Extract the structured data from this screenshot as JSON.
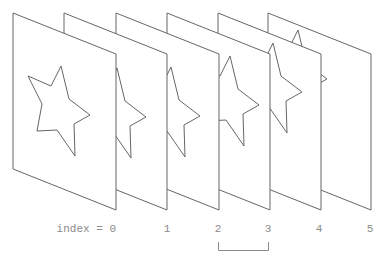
{
  "diagram": {
    "title": "",
    "frame_geometry": {
      "width": 103,
      "height": 156,
      "skew_drop": 41,
      "origin_y": 13
    },
    "frames": [
      {
        "index": 0,
        "x": 13,
        "star_offset": [
          0,
          0
        ]
      },
      {
        "index": 1,
        "x": 64,
        "star_offset": [
          5,
          2
        ]
      },
      {
        "index": 2,
        "x": 116,
        "star_offset": [
          7,
          1
        ]
      },
      {
        "index": 3,
        "x": 167,
        "star_offset": [
          15,
          -10
        ]
      },
      {
        "index": 4,
        "x": 218,
        "star_offset": [
          7,
          -23
        ]
      },
      {
        "index": 5,
        "x": 268,
        "star_offset": [
          -18,
          -36
        ]
      }
    ],
    "star_points_local": [
      [
        48,
        53
      ],
      [
        38,
        73
      ],
      [
        15,
        63
      ],
      [
        29,
        91
      ],
      [
        24,
        118
      ],
      [
        44,
        117
      ],
      [
        62,
        143
      ],
      [
        61,
        111
      ],
      [
        77,
        102
      ],
      [
        56,
        86
      ]
    ],
    "labels": [
      {
        "text": "index = 0",
        "x": 116,
        "anchor": "end"
      },
      {
        "text": "1",
        "x": 167,
        "anchor": "middle"
      },
      {
        "text": "2",
        "x": 218,
        "anchor": "middle"
      },
      {
        "text": "3",
        "x": 268,
        "anchor": "middle"
      },
      {
        "text": "4",
        "x": 319,
        "anchor": "middle"
      },
      {
        "text": "5",
        "x": 370,
        "anchor": "middle"
      }
    ],
    "label_y": 232,
    "bracket": {
      "from_index": 2,
      "to_index": 3,
      "x1": 218,
      "x2": 268,
      "y_top": 242,
      "y_bottom": 250
    },
    "colors": {
      "stroke": "#666666",
      "label": "#8a8a8a"
    }
  }
}
